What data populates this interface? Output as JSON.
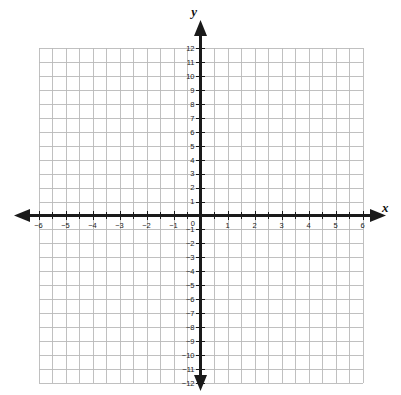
{
  "figure": {
    "type": "coordinate-plane",
    "title": "",
    "background_color": "#ffffff",
    "grid_color": "#b9b9b9",
    "axis_color": "#1a1a1a",
    "label_color": "#1a1a1a"
  },
  "axes": {
    "x_axis_name": "x",
    "y_axis_name": "y",
    "origin_label": "0",
    "x_label_positions": [
      -6,
      -5,
      -4,
      -3,
      -2,
      -1,
      1,
      2,
      3,
      4,
      5,
      6
    ],
    "y_label_positions": [
      12,
      11,
      10,
      9,
      8,
      7,
      6,
      5,
      4,
      3,
      2,
      1,
      -1,
      -2,
      -3,
      -4,
      -5,
      -6,
      -7,
      -8,
      -9,
      -10,
      -11,
      -12
    ],
    "x_tick_labels": [
      "−6",
      "−5",
      "−4",
      "−3",
      "−2",
      "−1",
      "1",
      "2",
      "3",
      "4",
      "5",
      "6"
    ],
    "y_tick_labels": [
      "12",
      "11",
      "10",
      "9",
      "8",
      "7",
      "6",
      "5",
      "4",
      "3",
      "2",
      "1",
      "−1",
      "−2",
      "−3",
      "−4",
      "−5",
      "−6",
      "−7",
      "−8",
      "−9",
      "−10",
      "−11",
      "−12"
    ],
    "arrow_directions": [
      "left",
      "right",
      "up",
      "down"
    ]
  },
  "chart_data": {
    "type": "scatter",
    "title": "",
    "xlabel": "x",
    "ylabel": "y",
    "xlim": [
      -6,
      6
    ],
    "ylim": [
      -12,
      12
    ],
    "x_major_step": 1,
    "x_minor_step": 0.5,
    "y_major_step": 1,
    "y_minor_step": 1,
    "grid": true,
    "legend": "none",
    "series": [],
    "x": [],
    "values": [],
    "annotations": [],
    "note": "Empty blank coordinate grid; no data plotted."
  }
}
